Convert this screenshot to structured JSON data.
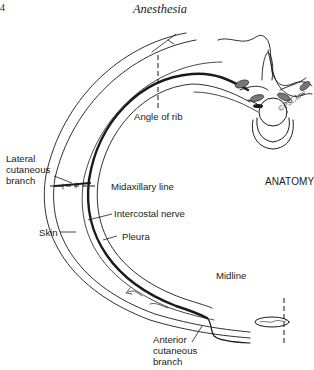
{
  "header": {
    "page_number": "4",
    "running_head": "Anesthesia"
  },
  "figure": {
    "section_tag": "ANATOMY",
    "signature": "©PSClow",
    "labels": {
      "angle_of_rib": "Angle of rib",
      "lateral_cutaneous_branch_line1": "Lateral",
      "lateral_cutaneous_branch_line2": "cutaneous",
      "lateral_cutaneous_branch_line3": "branch",
      "midaxillary_line": "Midaxillary line",
      "intercostal_nerve": "Intercostal nerve",
      "skin": "Skin",
      "pleura": "Pleura",
      "midline": "Midline",
      "anterior_cutaneous_branch_line1": "Anterior",
      "anterior_cutaneous_branch_line2": "cutaneous",
      "anterior_cutaneous_branch_line3": "branch"
    },
    "colors": {
      "ink": "#1a1a1a",
      "shading": "#777777",
      "background": "#ffffff"
    }
  }
}
